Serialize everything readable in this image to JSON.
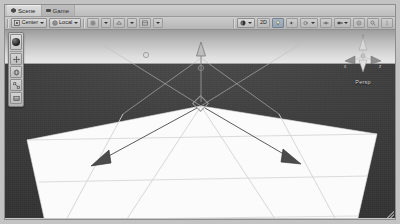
{
  "window": {
    "title": "Scene",
    "grip_name": "resize-grip"
  },
  "tabs": [
    {
      "label": "Scene",
      "icon": "scene-icon",
      "active": true
    },
    {
      "label": "Game",
      "icon": "game-icon",
      "active": false
    }
  ],
  "toolbar": {
    "pivot_mode": {
      "label": "Center",
      "icon": "pivot-center-icon"
    },
    "pivot_rotation": {
      "label": "Local",
      "icon": "handle-local-icon"
    },
    "buttons": [
      {
        "name": "grid-snap-toggle",
        "icon": "grid-icon",
        "label": ""
      },
      {
        "name": "grid-snap-dropdown",
        "icon": "chevron-down-icon",
        "label": ""
      },
      {
        "name": "grid-visibility-toggle",
        "icon": "grid-visibility-icon",
        "label": ""
      },
      {
        "name": "grid-visibility-dropdown",
        "icon": "chevron-down-icon",
        "label": ""
      },
      {
        "name": "snap-increment-toggle",
        "icon": "magnet-icon",
        "label": ""
      },
      {
        "name": "snap-increment-dropdown",
        "icon": "chevron-down-icon",
        "label": ""
      }
    ],
    "right_buttons": [
      {
        "name": "draw-mode-dropdown",
        "icon": "shaded-sphere-icon",
        "label": ""
      },
      {
        "name": "view-2d-toggle",
        "icon": "2d-icon",
        "label": "2D"
      },
      {
        "name": "scene-lighting-toggle",
        "icon": "lightbulb-icon",
        "label": ""
      },
      {
        "name": "scene-audio-toggle",
        "icon": "speaker-icon",
        "label": ""
      },
      {
        "name": "fx-dropdown",
        "icon": "fx-icon",
        "label": ""
      },
      {
        "name": "hidden-objects-toggle",
        "icon": "eye-icon",
        "label": ""
      },
      {
        "name": "scene-camera-dropdown",
        "icon": "camera-icon",
        "label": ""
      },
      {
        "name": "gizmos-toggle",
        "icon": "gizmos-icon",
        "label": ""
      },
      {
        "name": "search-field",
        "icon": "search-icon",
        "label": ""
      },
      {
        "name": "view-options-menu",
        "icon": "kebab-menu-icon",
        "label": ""
      }
    ]
  },
  "tool_palette": {
    "items": [
      {
        "name": "tool-view-sphere",
        "icon": "sphere-icon"
      },
      {
        "name": "tool-move",
        "icon": "move-tool-icon"
      },
      {
        "name": "tool-rotate",
        "icon": "rotate-tool-icon"
      },
      {
        "name": "tool-scale",
        "icon": "scale-tool-icon"
      },
      {
        "name": "tool-rect",
        "icon": "rect-tool-icon"
      }
    ]
  },
  "viewport": {
    "orientation_gizmo": {
      "name": "scene-orientation-gizmo",
      "perspective_label": "Persp",
      "top_label": "y",
      "axes": [
        {
          "axis": "x",
          "label": "x"
        },
        {
          "axis": "y",
          "label": "y"
        },
        {
          "axis": "z",
          "label": "z"
        }
      ]
    },
    "selected_object": {
      "name": "move-gizmo",
      "handles": [
        {
          "axis": "y",
          "direction": "up"
        },
        {
          "axis": "x",
          "direction": "down-left"
        },
        {
          "axis": "z",
          "direction": "down-right"
        }
      ]
    }
  },
  "colors": {
    "sky_top": "#9d9d9d",
    "sky_horizon": "#e8e8e8",
    "ground": "#3b3b3b",
    "plane": "#fbfbfb",
    "grid_line": "#cfcfcf",
    "chrome": "#c8c8c8",
    "gizmo_dark": "#4b4b4b"
  }
}
